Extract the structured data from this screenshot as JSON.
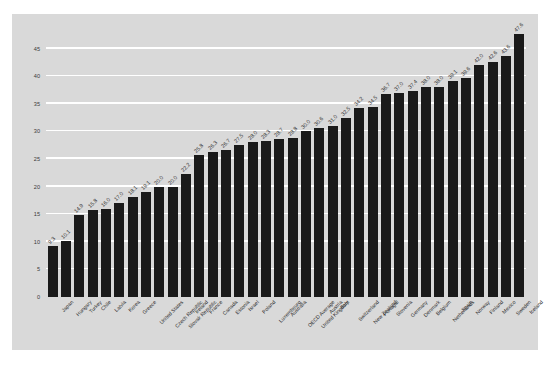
{
  "chart_data": {
    "type": "bar",
    "title": "",
    "subtitle": "",
    "xlabel": "",
    "ylabel": "",
    "ylim": [
      0,
      48
    ],
    "yticks": [
      0,
      5,
      10,
      15,
      20,
      25,
      30,
      35,
      40,
      45
    ],
    "grid": true,
    "legend": "none",
    "bar_color": "#1a1a1a",
    "panel_color": "#d9d9d9",
    "gridline_color": "#ffffff",
    "categories": [
      "Japan",
      "Hungary",
      "Turkey",
      "Chile",
      "Latvia",
      "Korea",
      "Greece",
      "United States",
      "Czech Republic",
      "Slovak Republic",
      "Ireland",
      "France",
      "Canada",
      "Estonia",
      "Israel",
      "Poland",
      "Luxembourg",
      "Australia",
      "OECD Average",
      "United Kingdom",
      "Austria",
      "Italy",
      "Switzerland",
      "New Zealand",
      "Portugal",
      "Slovenia",
      "Germany",
      "Denmark",
      "Belgium",
      "Netherlands",
      "Spain",
      "Norway",
      "Finland",
      "Mexico",
      "Sweden",
      "Iceland"
    ],
    "values": [
      9.3,
      10.1,
      14.9,
      15.8,
      16.0,
      17.0,
      18.1,
      19.1,
      20.0,
      20.0,
      22.2,
      25.8,
      26.3,
      26.7,
      27.5,
      28.0,
      28.3,
      28.7,
      28.8,
      30.0,
      30.6,
      31.0,
      32.5,
      34.2,
      34.5,
      36.7,
      37.0,
      37.4,
      38.0,
      38.0,
      39.1,
      39.6,
      42.0,
      42.6,
      43.6,
      47.6
    ],
    "value_labels": [
      "9.3",
      "10.1",
      "14.9",
      "15.8",
      "16.0",
      "17.0",
      "18.1",
      "19.1",
      "20.0",
      "20.0",
      "22.2",
      "25.8",
      "26.3",
      "26.7",
      "27.5",
      "28.0",
      "28.3",
      "28.7",
      "28.8",
      "30.0",
      "30.6",
      "31.0",
      "32.5",
      "34.2",
      "34.5",
      "36.7",
      "37.0",
      "37.4",
      "38.0",
      "38.0",
      "39.1",
      "39.6",
      "42.0",
      "42.6",
      "43.6",
      "47.6"
    ],
    "ytick_labels": [
      "0",
      "5",
      "10",
      "15",
      "20",
      "25",
      "30",
      "35",
      "40",
      "45"
    ]
  }
}
